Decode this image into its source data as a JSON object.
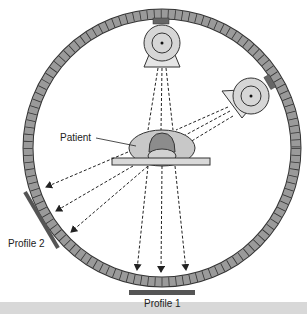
{
  "diagram": {
    "type": "ct-scanner-cross-section",
    "labels": {
      "patient": "Patient",
      "profile1": "Profile 1",
      "profile2": "Profile 2"
    },
    "colors": {
      "ring_fill": "#9a9a9a",
      "ring_stroke": "#333333",
      "tube_fill": "#d6d6d6",
      "patient_body": "#c8c8c8",
      "patient_head": "#8c8c8c",
      "table": "#d9d9d9",
      "profile_bar": "#555555",
      "background": "#ffffff"
    }
  }
}
